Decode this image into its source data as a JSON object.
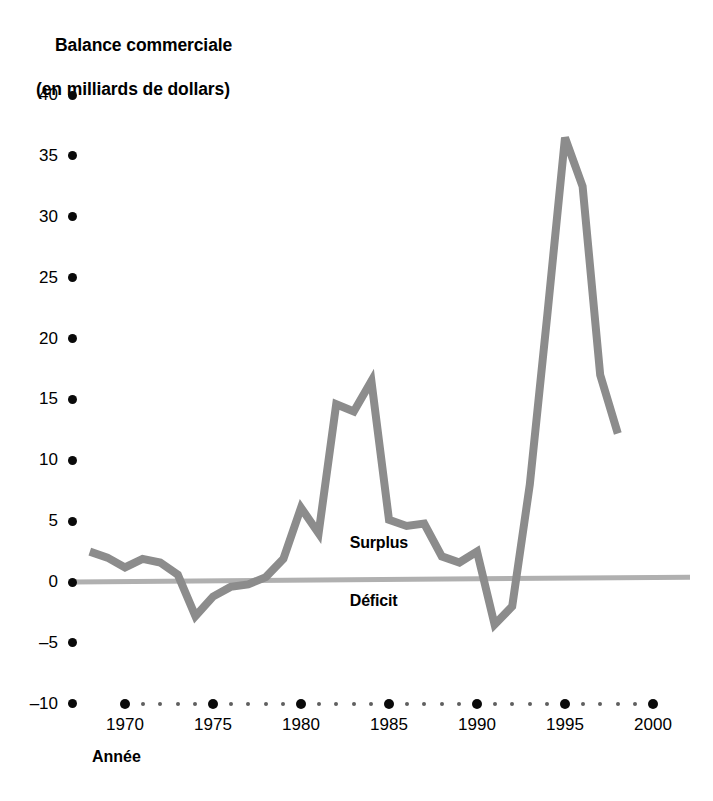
{
  "chart_data": {
    "type": "line",
    "title": "Balance commerciale",
    "subtitle": "(en milliards de dollars)",
    "xlabel": "Année",
    "ylabel": "",
    "xlim": [
      1967,
      2001
    ],
    "ylim": [
      -10,
      40
    ],
    "yticks": [
      40,
      35,
      30,
      25,
      20,
      15,
      10,
      5,
      0,
      -5,
      -10
    ],
    "ytick_labels": [
      "40",
      "35",
      "30",
      "25",
      "20",
      "15",
      "10",
      "5",
      "0",
      "–5",
      "–10"
    ],
    "xticks": [
      1970,
      1975,
      1980,
      1985,
      1990,
      1995,
      2000
    ],
    "xtick_labels": [
      "1970",
      "1975",
      "1980",
      "1985",
      "1990",
      "1995",
      "2000"
    ],
    "grid": false,
    "legend": "none",
    "zero_line": 0,
    "annotations": [
      {
        "text": "Surplus",
        "x": 1983,
        "y": 3.2
      },
      {
        "text": "Déficit",
        "x": 1983,
        "y": -1.6
      }
    ],
    "series": [
      {
        "name": "Balance commerciale",
        "color": "#8c8c8c",
        "x": [
          1968,
          1969,
          1970,
          1971,
          1972,
          1973,
          1974,
          1975,
          1976,
          1977,
          1978,
          1979,
          1980,
          1981,
          1982,
          1983,
          1984,
          1985,
          1986,
          1987,
          1988,
          1989,
          1990,
          1991,
          1992,
          1993,
          1994,
          1995,
          1996,
          1997,
          1998
        ],
        "values": [
          2.5,
          2.0,
          1.2,
          1.9,
          1.6,
          0.6,
          -2.8,
          -1.2,
          -0.4,
          -0.2,
          0.4,
          1.9,
          6.1,
          4.0,
          14.6,
          14.0,
          16.5,
          5.1,
          4.6,
          4.8,
          2.1,
          1.6,
          2.5,
          -3.5,
          -2.0,
          8.0,
          22.0,
          36.5,
          32.5,
          17.0,
          12.2
        ]
      }
    ]
  }
}
